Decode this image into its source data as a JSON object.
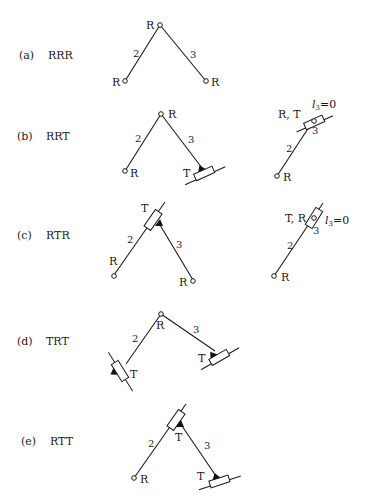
{
  "figure": {
    "rows": [
      {
        "id": "a",
        "tag": "(a)",
        "type": "RRR",
        "main": {
          "top_joint": "R",
          "left_joint": "R",
          "right_joint": "R",
          "link_left": "2",
          "link_right": "3"
        }
      },
      {
        "id": "b",
        "tag": "(b)",
        "type": "RRT",
        "main": {
          "top_joint": "R",
          "left_joint": "R",
          "right_joint": "T",
          "link_left": "2",
          "link_right": "3"
        },
        "alt": {
          "top_joint": "R, T",
          "bottom_joint": "R",
          "link_lower": "2",
          "link_upper": "3",
          "note_var": "l",
          "note_sub": "3",
          "note_eq": "=0"
        }
      },
      {
        "id": "c",
        "tag": "(c)",
        "type": "RTR",
        "main": {
          "top_joint": "T",
          "left_joint": "R",
          "right_joint": "R",
          "link_left": "2",
          "link_right": "3"
        },
        "alt": {
          "top_joint": "T, R",
          "bottom_joint": "R",
          "link_lower": "2",
          "link_upper": "3",
          "note_var": "l",
          "note_sub": "3",
          "note_eq": "=0"
        }
      },
      {
        "id": "d",
        "tag": "(d)",
        "type": "TRT",
        "main": {
          "top_joint": "R",
          "left_joint": "T",
          "right_joint": "T",
          "link_left": "2",
          "link_right": "3"
        }
      },
      {
        "id": "e",
        "tag": "(e)",
        "type": "RTT",
        "main": {
          "top_joint": "T",
          "left_joint": "R",
          "right_joint": "T",
          "link_left": "2",
          "link_right": "3"
        }
      }
    ],
    "legend": {
      "R": "revolute joint (circle)",
      "T": "prismatic joint (slider box on rail)"
    }
  }
}
